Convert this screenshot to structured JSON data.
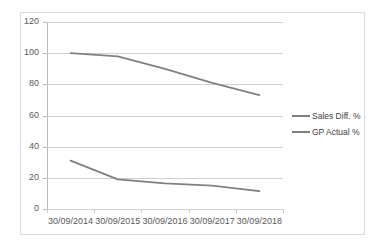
{
  "chart_data": {
    "type": "line",
    "title": "",
    "xlabel": "",
    "ylabel": "",
    "categories": [
      "30/09/2014",
      "30/09/2015",
      "30/09/2016",
      "30/09/2017",
      "30/09/2018"
    ],
    "series": [
      {
        "name": "Sales Diff. %",
        "values": [
          31,
          19,
          16.5,
          15,
          11.5
        ],
        "color": "#808080"
      },
      {
        "name": "GP Actual %",
        "values": [
          100,
          98,
          90,
          81,
          73
        ],
        "color": "#808080"
      }
    ],
    "ylim": [
      0,
      120
    ],
    "ytick_values": [
      0,
      20,
      40,
      60,
      80,
      100,
      120
    ],
    "ytick_labels": [
      "0",
      "20",
      "40",
      "60",
      "80",
      "100",
      "120"
    ],
    "grid": "horizontal",
    "legend_position": "right",
    "axis_color": "#b8b8b8",
    "gridline_color": "#d0d0d0",
    "border_color": "#d9d9d9",
    "tick_label_color": "#595959"
  },
  "legend": {
    "entries": [
      {
        "label": "Sales Diff. %"
      },
      {
        "label": "GP Actual %"
      }
    ]
  }
}
